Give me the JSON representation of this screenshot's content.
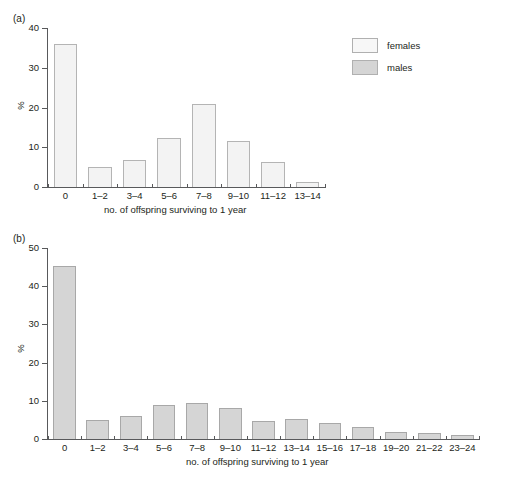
{
  "figure": {
    "background": "#ffffff",
    "axis_color": "#58595b",
    "text_color": "#231f20"
  },
  "legend": {
    "position": "top-right",
    "entries": [
      {
        "label": "females",
        "color": "#f3f3f3",
        "swatch_name": "legend-swatch-females"
      },
      {
        "label": "males",
        "color": "#d5d5d5",
        "swatch_name": "legend-swatch-males"
      }
    ]
  },
  "panels": [
    {
      "tag": "(a)",
      "series": "females"
    },
    {
      "tag": "(b)",
      "series": "males"
    }
  ],
  "chart_data": [
    {
      "type": "bar",
      "panel": "(a)",
      "title": "",
      "series_name": "females",
      "categories": [
        "0",
        "1–2",
        "3–4",
        "5–6",
        "7–8",
        "9–10",
        "11–12",
        "13–14"
      ],
      "values": [
        36.0,
        5.0,
        6.7,
        12.3,
        20.8,
        11.6,
        6.4,
        1.3
      ],
      "xlabel": "no. of offspring surviving to 1 year",
      "ylabel": "%",
      "ylim": [
        0,
        40
      ],
      "yticks": [
        0,
        10,
        20,
        30,
        40
      ],
      "grid": false,
      "bar_fill": "#f3f3f3",
      "bar_edge": "#b4b4b4"
    },
    {
      "type": "bar",
      "panel": "(b)",
      "title": "",
      "series_name": "males",
      "categories": [
        "0",
        "1–2",
        "3–4",
        "5–6",
        "7–8",
        "9–10",
        "11–12",
        "13–14",
        "15–16",
        "17–18",
        "19–20",
        "21–22",
        "23–24"
      ],
      "values": [
        45.3,
        5.0,
        5.9,
        9.0,
        9.3,
        8.0,
        4.8,
        5.3,
        4.3,
        3.1,
        1.9,
        1.5,
        1.1
      ],
      "xlabel": "no. of offspring surviving to 1 year",
      "ylabel": "%",
      "ylim": [
        0,
        50
      ],
      "yticks": [
        0,
        10,
        20,
        30,
        40,
        50
      ],
      "grid": false,
      "bar_fill": "#d5d5d5",
      "bar_edge": "#a8a8a8"
    }
  ]
}
